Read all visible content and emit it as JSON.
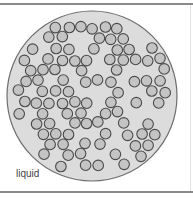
{
  "diagram": {
    "state_label": "liquid",
    "particle_count": 170,
    "colors": {
      "container_fill": "#dcdcdc",
      "container_stroke": "#6e6e6e",
      "particle_fill": "#c4c4c4",
      "particle_stroke": "#4a4a4a",
      "frame_line": "#8a8a8a"
    }
  }
}
